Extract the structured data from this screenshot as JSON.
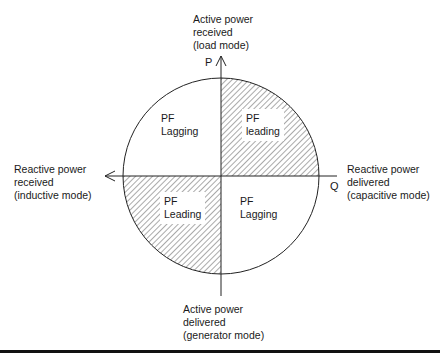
{
  "diagram": {
    "type": "power-factor-quadrant-diagram",
    "axes": {
      "vertical": {
        "symbol": "P",
        "top_label": [
          "Active power",
          "received",
          "(load mode)"
        ],
        "bottom_label": [
          "Active power",
          "delivered",
          "(generator mode)"
        ]
      },
      "horizontal": {
        "symbol": "Q",
        "left_label": [
          "Reactive power",
          "received",
          "(inductive mode)"
        ],
        "right_label": [
          "Reactive power",
          "delivered",
          "(capacitive mode)"
        ]
      }
    },
    "quadrants": [
      {
        "position": "top-left",
        "lines": [
          "PF",
          "Lagging"
        ],
        "hatched": false
      },
      {
        "position": "top-right",
        "lines": [
          "PF",
          "leading"
        ],
        "hatched": true
      },
      {
        "position": "bottom-left",
        "lines": [
          "PF",
          "Leading"
        ],
        "hatched": true
      },
      {
        "position": "bottom-right",
        "lines": [
          "PF",
          "Lagging"
        ],
        "hatched": false
      }
    ],
    "colors": {
      "line": "#222222",
      "hatch": "#555555",
      "background": "#ffffff"
    }
  }
}
